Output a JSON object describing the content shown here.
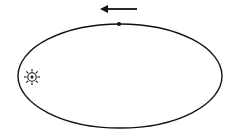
{
  "diagram": {
    "title": "Elliptical orbit of a planet around the Sun",
    "colors": {
      "stroke": "#111111",
      "background": "#ffffff"
    },
    "orbit": {
      "shape": "ellipse",
      "cx": 120,
      "cy": 76,
      "rx": 102,
      "ry": 52
    },
    "sun": {
      "symbol": "sun-icon",
      "cx": 32,
      "cy": 77,
      "r": 4,
      "ray_length": 8,
      "rays": 8
    },
    "planet": {
      "symbol": "dot",
      "cx": 119,
      "cy": 24,
      "r": 2
    },
    "direction_arrow": {
      "direction": "left",
      "x1": 137,
      "x2": 100,
      "y": 9
    }
  }
}
